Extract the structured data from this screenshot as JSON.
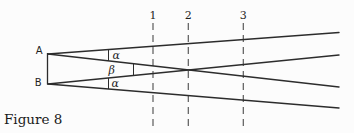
{
  "figure": {
    "caption": "Figure 8",
    "points": {
      "a": "A",
      "b": "B"
    },
    "angles": {
      "alpha_top": "α",
      "beta": "β",
      "alpha_bottom": "α"
    },
    "screens": [
      "1",
      "2",
      "3"
    ],
    "colors": {
      "line": "#2c2c2c",
      "dashed_line": "#5a5a5a",
      "text": "#1f1f1f",
      "background": "#fcfcfc"
    }
  }
}
